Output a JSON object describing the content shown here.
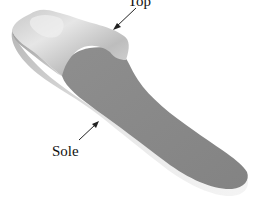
{
  "figure": {
    "labels": {
      "top": "Top",
      "sole": "Sole"
    },
    "colors": {
      "background": "#ffffff",
      "sole_face": "#8a8a8a",
      "sole_edge": "#e4e4e4",
      "top_surface": "#d6d6d6",
      "top_shadow": "#a8a8a8",
      "arrow": "#222222",
      "text": "#111111"
    }
  }
}
